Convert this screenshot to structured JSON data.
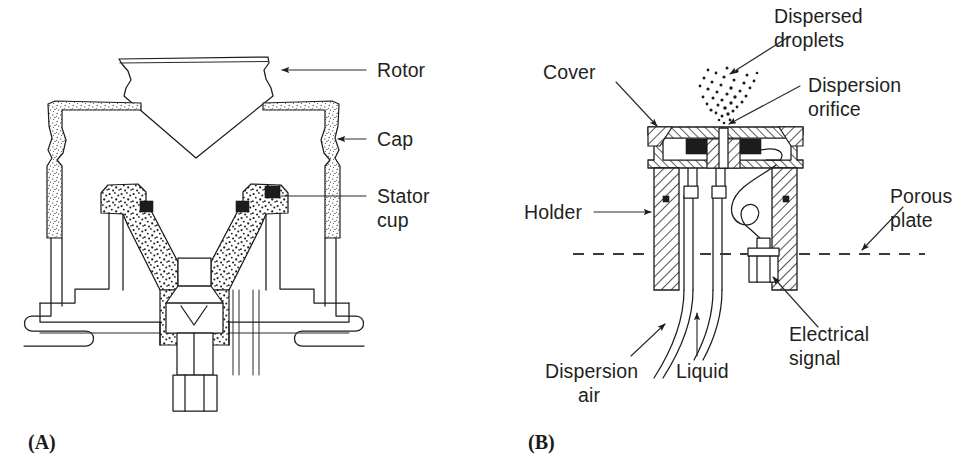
{
  "figure": {
    "background_color": "#ffffff",
    "ink_color": "#1c1c1c",
    "text_color": "#231f20",
    "panels": [
      {
        "id": "A",
        "caption": "(A)",
        "subject": "rotary atomizer cross-section",
        "labels": [
          {
            "key": "rotor",
            "text": "Rotor",
            "leader": "horizontal-line-with-arrow",
            "points_to": "rotor-body-right-edge"
          },
          {
            "key": "cap",
            "text": "Cap",
            "leader": "horizontal-line-with-arrow",
            "points_to": "cap-right-wall"
          },
          {
            "key": "stator_cup_line1",
            "text": "Stator",
            "leader": "horizontal-line",
            "points_to": "stator-cup-right-shoulder"
          },
          {
            "key": "stator_cup_line2",
            "text": "cup",
            "leader": "none",
            "points_to": ""
          }
        ]
      },
      {
        "id": "B",
        "caption": "(B)",
        "subject": "dispersion nozzle cross-section",
        "labels": [
          {
            "key": "dispersed_droplets_line1",
            "text": "Dispersed",
            "leader": "diagonal-arrow",
            "points_to": "droplet-cloud"
          },
          {
            "key": "dispersed_droplets_line2",
            "text": "droplets",
            "leader": "none",
            "points_to": ""
          },
          {
            "key": "cover",
            "text": "Cover",
            "leader": "diagonal-arrow",
            "points_to": "cover-plate-left"
          },
          {
            "key": "dispersion_orifice_line1",
            "text": "Dispersion",
            "leader": "diagonal-arrow",
            "points_to": "orifice-opening"
          },
          {
            "key": "dispersion_orifice_line2",
            "text": "orifice",
            "leader": "none",
            "points_to": ""
          },
          {
            "key": "holder",
            "text": "Holder",
            "leader": "horizontal-arrow",
            "points_to": "holder-left-wall"
          },
          {
            "key": "porous_plate_line1",
            "text": "Porous",
            "leader": "diagonal-line",
            "points_to": "porous-plate-dashed-line"
          },
          {
            "key": "porous_plate_line2",
            "text": "plate",
            "leader": "none",
            "points_to": ""
          },
          {
            "key": "electrical_signal_line1",
            "text": "Electrical",
            "leader": "diagonal-arrow",
            "points_to": "sensor-body"
          },
          {
            "key": "electrical_signal_line2",
            "text": "signal",
            "leader": "none",
            "points_to": ""
          },
          {
            "key": "dispersion_air_line1",
            "text": "Dispersion",
            "leader": "diagonal-arrow",
            "points_to": "outer-tube"
          },
          {
            "key": "dispersion_air_line2",
            "text": "air",
            "leader": "none",
            "points_to": ""
          },
          {
            "key": "liquid",
            "text": "Liquid",
            "leader": "vertical-arrow",
            "points_to": "inner-tube"
          }
        ]
      }
    ]
  }
}
